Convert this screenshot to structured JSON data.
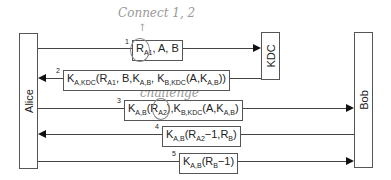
{
  "actors": {
    "alice": "Alice",
    "kdc": "KDC",
    "bob": "Bob"
  },
  "annotations": {
    "connect": "Connect 1, 2",
    "challenge": "challenge"
  },
  "messages": [
    {
      "num": "1",
      "direction": "Alice→KDC"
    },
    {
      "num": "2",
      "direction": "KDC→Alice"
    },
    {
      "num": "3",
      "direction": "Alice→Bob"
    },
    {
      "num": "4",
      "direction": "Bob→Alice"
    },
    {
      "num": "5",
      "direction": "Alice→Bob"
    }
  ],
  "labels": {
    "m1": [
      "R",
      "A1",
      ", A, B"
    ],
    "m2": "K_A,KDC(R_A1, B, K_A,B, K_B,KDC(A, K_A,B))",
    "m3": "K_A,B(R_A2), K_B,KDC(A, K_A,B)",
    "m4": "K_A,B(R_A2−1, R_B)",
    "m5": "K_A,B(R_B−1)"
  },
  "colors": {
    "line": "#444444",
    "handwriting": "#999999"
  }
}
